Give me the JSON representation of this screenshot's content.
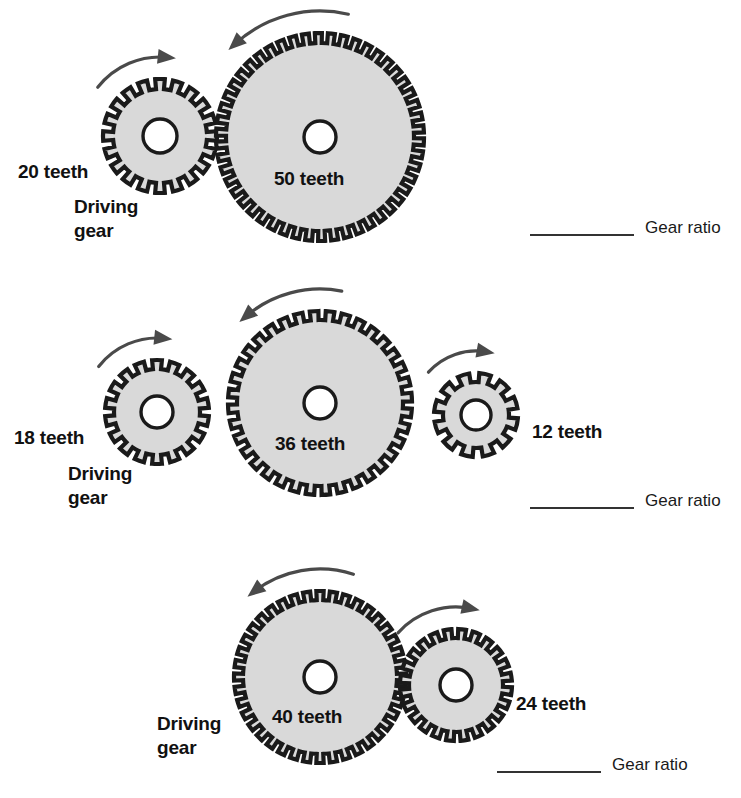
{
  "page": {
    "background_color": "#ffffff",
    "gear_fill_color": "#d9d9d9",
    "gear_outline_color": "#1a1a1a",
    "hub_fill_color": "#ffffff",
    "arrow_color": "#4a4a4a",
    "text_color": "#111111"
  },
  "rows": [
    {
      "id": "row-1",
      "gears": [
        {
          "teeth": 20,
          "label": "20 teeth",
          "role_label": "Driving\ngear",
          "is_driving": true,
          "direction": "clockwise",
          "cx": 160,
          "cy": 136,
          "outer_radius": 57,
          "root_radius": 47,
          "hub_radius": 17
        },
        {
          "teeth": 50,
          "label": "50 teeth",
          "role_label": "",
          "is_driving": false,
          "direction": "counterclockwise",
          "cx": 320,
          "cy": 137,
          "outer_radius": 104,
          "root_radius": 94,
          "hub_radius": 16
        }
      ],
      "answer": {
        "label": "Gear ratio",
        "value": "",
        "placeholder": ""
      }
    },
    {
      "id": "row-2",
      "gears": [
        {
          "teeth": 18,
          "label": "18 teeth",
          "role_label": "Driving\ngear",
          "is_driving": true,
          "direction": "clockwise",
          "cx": 157,
          "cy": 412,
          "outer_radius": 52,
          "root_radius": 43,
          "hub_radius": 16
        },
        {
          "teeth": 36,
          "label": "36 teeth",
          "role_label": "",
          "is_driving": false,
          "direction": "counterclockwise",
          "cx": 320,
          "cy": 403,
          "outer_radius": 92,
          "root_radius": 83,
          "hub_radius": 16
        },
        {
          "teeth": 12,
          "label": "12 teeth",
          "role_label": "",
          "is_driving": false,
          "direction": "clockwise",
          "cx": 476,
          "cy": 415,
          "outer_radius": 42,
          "root_radius": 33,
          "hub_radius": 15
        }
      ],
      "answer": {
        "label": "Gear ratio",
        "value": "",
        "placeholder": ""
      }
    },
    {
      "id": "row-3",
      "gears": [
        {
          "teeth": 40,
          "label": "40 teeth",
          "role_label": "Driving\ngear",
          "is_driving": true,
          "direction": "counterclockwise",
          "cx": 320,
          "cy": 677,
          "outer_radius": 86,
          "root_radius": 77,
          "hub_radius": 16
        },
        {
          "teeth": 24,
          "label": "24 teeth",
          "role_label": "",
          "is_driving": false,
          "direction": "clockwise",
          "cx": 456,
          "cy": 685,
          "outer_radius": 56,
          "root_radius": 47,
          "hub_radius": 16
        }
      ],
      "answer": {
        "label": "Gear ratio",
        "value": "",
        "placeholder": ""
      }
    }
  ],
  "text_labels": {
    "r1_teeth_a": "20 teeth",
    "r1_driving_1": "Driving",
    "r1_driving_2": "gear",
    "r1_teeth_b": "50 teeth",
    "r1_ratio": "Gear ratio",
    "r2_teeth_a": "18 teeth",
    "r2_driving_1": "Driving",
    "r2_driving_2": "gear",
    "r2_teeth_b": "36 teeth",
    "r2_teeth_c": "12 teeth",
    "r2_ratio": "Gear ratio",
    "r3_driving_1": "Driving",
    "r3_driving_2": "gear",
    "r3_teeth_a": "40 teeth",
    "r3_teeth_b": "24 teeth",
    "r3_ratio": "Gear ratio"
  }
}
